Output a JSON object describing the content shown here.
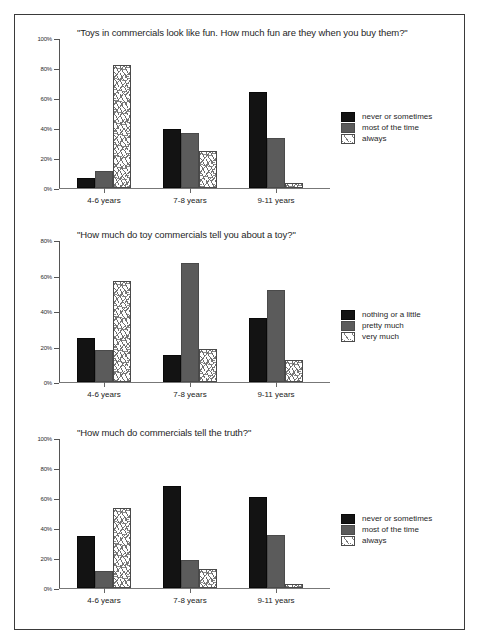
{
  "figure": {
    "background": "#ffffff",
    "frame_color": "#3a3a3a"
  },
  "palette": {
    "series_0": "#131313",
    "series_1": "#5b5b5b",
    "series_2": "#ffffff"
  },
  "chart_data": [
    {
      "type": "bar",
      "title": "\"Toys in commercials look like fun. How much fun are they when you buy them?\"",
      "xlabel": "",
      "ylabel": "",
      "ylim": [
        0,
        100
      ],
      "yticks": [
        "0%",
        "20%",
        "40%",
        "60%",
        "80%",
        "100%"
      ],
      "ytick_values": [
        0,
        20,
        40,
        60,
        80,
        100
      ],
      "grid": false,
      "legend_position": "right",
      "categories": [
        "4-6 years",
        "7-8 years",
        "9-11 years"
      ],
      "series": [
        {
          "name": "never or sometimes",
          "values": [
            7,
            39.5,
            64
          ]
        },
        {
          "name": "most of the time",
          "values": [
            11.5,
            36.5,
            33.5
          ]
        },
        {
          "name": "always",
          "values": [
            82,
            24.5,
            3.5
          ]
        }
      ]
    },
    {
      "type": "bar",
      "title": "\"How much do toy commercials tell you about a toy?\"",
      "xlabel": "",
      "ylabel": "",
      "ylim": [
        0,
        80
      ],
      "yticks": [
        "0%",
        "20%",
        "40%",
        "60%",
        "80%"
      ],
      "ytick_values": [
        0,
        20,
        40,
        60,
        80
      ],
      "grid": false,
      "legend_position": "right",
      "categories": [
        "4-6 years",
        "7-8 years",
        "9-11 years"
      ],
      "series": [
        {
          "name": "nothing or a little",
          "values": [
            25,
            15,
            36
          ]
        },
        {
          "name": "pretty much",
          "values": [
            18,
            67,
            52
          ]
        },
        {
          "name": "very much",
          "values": [
            57,
            18.5,
            12.5
          ]
        }
      ]
    },
    {
      "type": "bar",
      "title": "\"How much do commercials tell the truth?\"",
      "xlabel": "",
      "ylabel": "",
      "ylim": [
        0,
        100
      ],
      "yticks": [
        "0%",
        "20%",
        "40%",
        "60%",
        "80%",
        "100%"
      ],
      "ytick_values": [
        0,
        20,
        40,
        60,
        80,
        100
      ],
      "grid": false,
      "legend_position": "right",
      "categories": [
        "4-6 years",
        "7-8 years",
        "9-11 years"
      ],
      "series": [
        {
          "name": "never or sometimes",
          "values": [
            35,
            68,
            60.5
          ]
        },
        {
          "name": "most of the time",
          "values": [
            11.5,
            18.5,
            35.5
          ]
        },
        {
          "name": "always",
          "values": [
            53.5,
            12.5,
            3
          ]
        }
      ]
    }
  ]
}
